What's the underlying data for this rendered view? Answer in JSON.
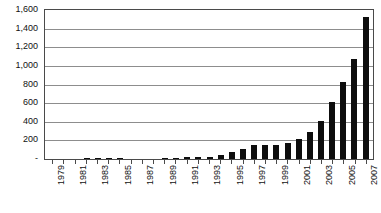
{
  "chart_data": {
    "type": "bar",
    "title": "",
    "subtitle": "",
    "xlabel": "",
    "ylabel": "",
    "grid": true,
    "legend": false,
    "legend_position": "none",
    "orientation": "vertical",
    "bar_color": "#0d0d0d",
    "plot_border_color": "#4a4a4a",
    "gridline_color": "#8d8d8d",
    "background_color": "#ffffff",
    "ylim": [
      0,
      1600
    ],
    "ytick_interval": 200,
    "ytick_labels": [
      "1,600",
      "1,400",
      "1,200",
      "1,000",
      "800",
      "600",
      "400",
      "200",
      "-"
    ],
    "ytick_values": [
      1600,
      1400,
      1200,
      1000,
      800,
      600,
      400,
      200,
      0
    ],
    "zero_label_style": "accounting-dash",
    "xtick_labels_shown": [
      "1979",
      "1981",
      "1983",
      "1985",
      "1987",
      "1989",
      "1991",
      "1993",
      "1995",
      "1997",
      "1999",
      "2001",
      "2003",
      "2005",
      "2007"
    ],
    "xtick_label_rotation": -90,
    "categories": [
      "1979",
      "1980",
      "1981",
      "1982",
      "1983",
      "1984",
      "1985",
      "1986",
      "1987",
      "1988",
      "1989",
      "1990",
      "1991",
      "1992",
      "1993",
      "1994",
      "1995",
      "1996",
      "1997",
      "1998",
      "1999",
      "2000",
      "2001",
      "2002",
      "2003",
      "2004",
      "2005",
      "2006",
      "2007"
    ],
    "values": [
      2,
      3,
      4,
      10,
      11,
      9,
      8,
      4,
      3,
      5,
      12,
      11,
      22,
      18,
      25,
      47,
      78,
      105,
      148,
      147,
      155,
      175,
      213,
      290,
      410,
      612,
      822,
      1072,
      1530
    ],
    "series": [
      {
        "name": "series-1",
        "values": [
          2,
          3,
          4,
          10,
          11,
          9,
          8,
          4,
          3,
          5,
          12,
          11,
          22,
          18,
          25,
          47,
          78,
          105,
          148,
          147,
          155,
          175,
          213,
          290,
          410,
          612,
          822,
          1072,
          1530
        ]
      }
    ]
  }
}
